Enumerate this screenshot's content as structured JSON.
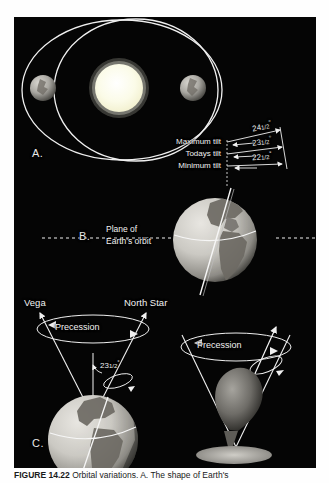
{
  "figure": {
    "caption_label": "FIGURE 14.22",
    "caption_text": "Orbital variations. A. The shape of Earth's"
  },
  "panel_a": {
    "letter": "A.",
    "sun_name": "sun",
    "earth_left_name": "earth-orbit-position-left",
    "earth_right_name": "earth-orbit-position-right",
    "orbit_outer_name": "elliptical-orbit-outer",
    "orbit_inner_name": "circular-orbit-inner"
  },
  "panel_b": {
    "letter": "B.",
    "plane_label_line1": "Plane of",
    "plane_label_line2": "Earth's orbit",
    "tilts": [
      {
        "name": "Maximum tilt",
        "degrees": "24",
        "fraction": "1/2",
        "unit": "°"
      },
      {
        "name": "Todays tilt",
        "degrees": "23",
        "fraction": "1/2",
        "unit": "°"
      },
      {
        "name": "Minimum tilt",
        "degrees": "22",
        "fraction": "1/2",
        "unit": "°"
      }
    ]
  },
  "panel_c": {
    "letter": "C.",
    "star_left": "Vega",
    "star_right": "North Star",
    "precession_left": "Precession",
    "precession_right": "Precession",
    "tilt_angle_degrees": "23",
    "tilt_angle_fraction": "1/2",
    "tilt_angle_unit": "°"
  },
  "colors": {
    "panel_background": "#050505",
    "line": "#f0f0f0",
    "sun": "#fdfdf0",
    "earth_land": "#6d6a63",
    "earth_ocean": "#c9c7c2",
    "page_background": "#ffffff",
    "caption_text": "#1a1a1a"
  }
}
